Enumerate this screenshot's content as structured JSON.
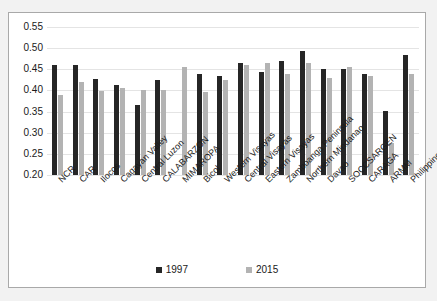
{
  "chart_data": {
    "type": "bar",
    "title": "",
    "xlabel": "",
    "ylabel": "",
    "ylim": [
      0.2,
      0.55
    ],
    "ytick_labels": [
      "0.55",
      "0.50",
      "0.45",
      "0.40",
      "0.35",
      "0.30",
      "0.25",
      "0.20"
    ],
    "ytick_values": [
      0.55,
      0.5,
      0.45,
      0.4,
      0.35,
      0.3,
      0.25,
      0.2
    ],
    "grid": true,
    "legend_position": "bottom-center",
    "categories": [
      "NCR",
      "CAR",
      "Ilocos",
      "Cagayan Valley",
      "Central Luzon",
      "CALABARZON",
      "MIMAROPA",
      "Bicol",
      "Western Visayas",
      "Central Visayas",
      "Eastern Visayas",
      "Zamboanga Peninsula",
      "Northern Mindanao",
      "Davao",
      "SOCCSARGEN",
      "CARAGA",
      "ARMM",
      "Philippines"
    ],
    "series": [
      {
        "name": "1997",
        "color": "#262626",
        "values": [
          0.461,
          0.461,
          0.428,
          0.414,
          0.366,
          0.425,
          null,
          0.44,
          0.434,
          0.466,
          0.444,
          0.47,
          0.494,
          0.451,
          0.45,
          0.439,
          0.351,
          0.485
        ]
      },
      {
        "name": "2015",
        "color": "#b3b3b3",
        "values": [
          0.39,
          0.42,
          0.399,
          0.406,
          0.4,
          0.4,
          0.456,
          0.396,
          0.425,
          0.46,
          0.465,
          0.44,
          0.465,
          0.43,
          0.455,
          0.434,
          0.275,
          0.44
        ]
      }
    ]
  },
  "legend": {
    "items": [
      {
        "label": "1997",
        "color": "#262626"
      },
      {
        "label": "2015",
        "color": "#b3b3b3"
      }
    ]
  },
  "colors": {
    "series_1997": "#262626",
    "series_2015": "#b3b3b3",
    "gridline": "#e4e4e4",
    "frame_border": "#a9a9a9",
    "plot_background": "#ffffff",
    "page_background": "#f2f2f2",
    "text": "#1a1a1a"
  }
}
